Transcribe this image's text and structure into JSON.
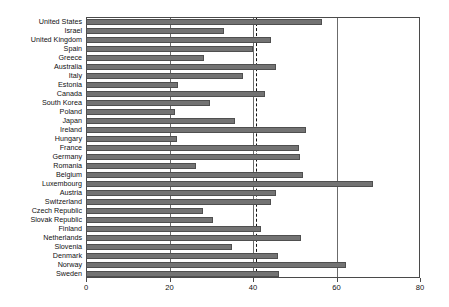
{
  "chart_data": {
    "type": "bar",
    "orientation": "horizontal",
    "title": "",
    "subtitle": "",
    "xlabel": "",
    "ylabel": "",
    "xlim": [
      0,
      80
    ],
    "ylim": null,
    "grid": true,
    "gridlines_x": [
      0,
      20,
      40,
      60,
      80
    ],
    "legend": null,
    "legend_position": "none",
    "xticks": [
      0,
      20,
      40,
      60,
      80
    ],
    "xticklabels": [
      "0",
      "20",
      "40",
      "60",
      "80"
    ],
    "annotations": [
      {
        "name": "average-reference-line",
        "type": "vertical-dashed-line",
        "value": 40.4,
        "label": ""
      }
    ],
    "bar_color": "#737373",
    "bar_edge_color": "#4f4f4f",
    "categories": [
      "United States",
      "Israel",
      "United Kingdom",
      "Spain",
      "Greece",
      "Australia",
      "Italy",
      "Estonia",
      "Canada",
      "South Korea",
      "Poland",
      "Japan",
      "Ireland",
      "Hungary",
      "France",
      "Germany",
      "Romania",
      "Belgium",
      "Luxembourg",
      "Austria",
      "Switzerland",
      "Czech Republic",
      "Slovak Republic",
      "Finland",
      "Netherlands",
      "Slovenia",
      "Denmark",
      "Norway",
      "Sweden"
    ],
    "values": [
      56.5,
      33.0,
      44.2,
      40.1,
      28.2,
      45.5,
      37.7,
      22.1,
      42.8,
      29.8,
      21.2,
      35.6,
      52.6,
      21.9,
      51.0,
      51.2,
      26.4,
      52.0,
      68.7,
      45.6,
      44.4,
      28.1,
      30.3,
      42.0,
      51.4,
      35.0,
      46.1,
      62.2,
      46.2
    ]
  }
}
